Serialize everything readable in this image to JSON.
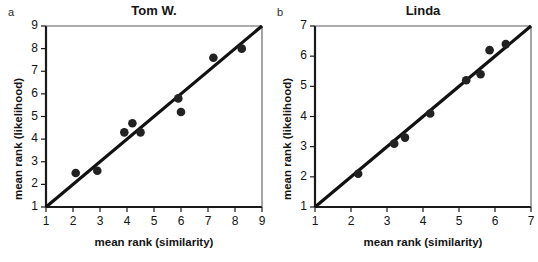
{
  "figure": {
    "background_color": "#ffffff",
    "ink_color": "#1a1a1a",
    "marker_color": "#222222",
    "line_color": "#111111"
  },
  "chart_data": [
    {
      "type": "scatter",
      "panel_letter": "a",
      "title": "Tom W.",
      "xlabel": "mean rank (similarity)",
      "ylabel": "mean rank (likelihood)",
      "xlim": [
        1,
        9
      ],
      "ylim": [
        1,
        9
      ],
      "xticks": [
        1,
        2,
        3,
        4,
        5,
        6,
        7,
        8,
        9
      ],
      "yticks": [
        1,
        2,
        3,
        4,
        5,
        6,
        7,
        8,
        9
      ],
      "xtick_labels": [
        "1",
        "2",
        "3",
        "4",
        "5",
        "6",
        "7",
        "8",
        "9"
      ],
      "ytick_labels": [
        "1",
        "2",
        "3",
        "4",
        "5",
        "6",
        "7",
        "8",
        "9"
      ],
      "grid": false,
      "legend": false,
      "points": [
        {
          "x": 2.1,
          "y": 2.5
        },
        {
          "x": 2.9,
          "y": 2.6
        },
        {
          "x": 3.9,
          "y": 4.3
        },
        {
          "x": 4.2,
          "y": 4.7
        },
        {
          "x": 4.5,
          "y": 4.3
        },
        {
          "x": 5.9,
          "y": 5.8
        },
        {
          "x": 6.0,
          "y": 5.2
        },
        {
          "x": 7.2,
          "y": 7.6
        },
        {
          "x": 8.25,
          "y": 8.0
        }
      ],
      "reference_line": {
        "description": "identity line y = x",
        "from": [
          1,
          1
        ],
        "to": [
          9,
          9
        ]
      }
    },
    {
      "type": "scatter",
      "panel_letter": "b",
      "title": "Linda",
      "xlabel": "mean rank (similarity)",
      "ylabel": "mean rank (likelihood)",
      "xlim": [
        1,
        7
      ],
      "ylim": [
        1,
        7
      ],
      "xticks": [
        1,
        2,
        3,
        4,
        5,
        6,
        7
      ],
      "yticks": [
        1,
        2,
        3,
        4,
        5,
        6,
        7
      ],
      "xtick_labels": [
        "1",
        "2",
        "3",
        "4",
        "5",
        "6",
        "7"
      ],
      "ytick_labels": [
        "1",
        "2",
        "3",
        "4",
        "5",
        "6",
        "7"
      ],
      "grid": false,
      "legend": false,
      "points": [
        {
          "x": 2.2,
          "y": 2.1
        },
        {
          "x": 3.2,
          "y": 3.1
        },
        {
          "x": 3.5,
          "y": 3.3
        },
        {
          "x": 4.2,
          "y": 4.1
        },
        {
          "x": 5.2,
          "y": 5.2
        },
        {
          "x": 5.6,
          "y": 5.4
        },
        {
          "x": 5.85,
          "y": 6.2
        },
        {
          "x": 6.3,
          "y": 6.4
        }
      ],
      "reference_line": {
        "description": "identity line y = x",
        "from": [
          1,
          1
        ],
        "to": [
          7,
          7
        ]
      }
    }
  ]
}
